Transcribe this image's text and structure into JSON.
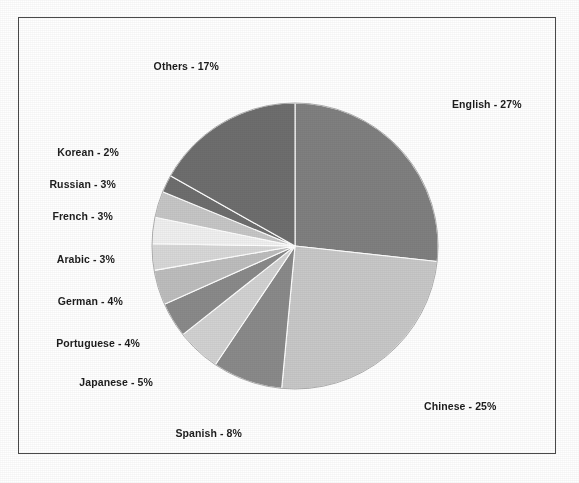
{
  "chart_data": {
    "type": "pie",
    "title": "",
    "subtitle": "",
    "xlabel": "",
    "ylabel": "",
    "legend_position": "none",
    "grid": false,
    "unit": "%",
    "start_angle_deg": 0,
    "direction": "clockwise",
    "total": 100,
    "categories": [
      "English",
      "Chinese",
      "Spanish",
      "Japanese",
      "Portuguese",
      "German",
      "Arabic",
      "French",
      "Russian",
      "Korean",
      "Others"
    ],
    "values": [
      27,
      25,
      8,
      5,
      4,
      4,
      3,
      3,
      3,
      2,
      17
    ],
    "slices": [
      {
        "name": "English",
        "value": 27,
        "label": "English - 27%",
        "color": "#808080",
        "label_x": 452,
        "label_y": 104,
        "align": "left"
      },
      {
        "name": "Chinese",
        "value": 25,
        "label": "Chinese - 25%",
        "color": "#c8c8c8",
        "label_x": 424,
        "label_y": 406,
        "align": "left"
      },
      {
        "name": "Spanish",
        "value": 8,
        "label": "Spanish - 8%",
        "color": "#8a8a8a",
        "label_x": 242,
        "label_y": 433,
        "align": "right"
      },
      {
        "name": "Japanese",
        "value": 5,
        "label": "Japanese - 5%",
        "color": "#d2d2d2",
        "label_x": 153,
        "label_y": 382,
        "align": "right"
      },
      {
        "name": "Portuguese",
        "value": 4,
        "label": "Portuguese - 4%",
        "color": "#8a8a8a",
        "label_x": 140,
        "label_y": 343,
        "align": "right"
      },
      {
        "name": "German",
        "value": 4,
        "label": "German - 4%",
        "color": "#bdbdbd",
        "label_x": 123,
        "label_y": 301,
        "align": "right"
      },
      {
        "name": "Arabic",
        "value": 3,
        "label": "Arabic - 3%",
        "color": "#d8d8d8",
        "label_x": 115,
        "label_y": 259,
        "align": "right"
      },
      {
        "name": "French",
        "value": 3,
        "label": "French - 3%",
        "color": "#f0f0f0",
        "label_x": 113,
        "label_y": 216,
        "align": "right"
      },
      {
        "name": "Russian",
        "value": 3,
        "label": "Russian - 3%",
        "color": "#c6c6c6",
        "label_x": 116,
        "label_y": 184,
        "align": "right"
      },
      {
        "name": "Korean",
        "value": 2,
        "label": "Korean - 2%",
        "color": "#6e6e6e",
        "label_x": 119,
        "label_y": 152,
        "align": "right"
      },
      {
        "name": "Others",
        "value": 17,
        "label": "Others - 17%",
        "color": "#6e6e6e",
        "label_x": 219,
        "label_y": 66,
        "align": "right"
      }
    ],
    "geometry": {
      "center_x": 295,
      "center_y": 246,
      "radius": 143,
      "separator_color": "#ffffff",
      "separator_width": 1.1
    },
    "frame": {
      "border_color": "#4a4a4a",
      "background": "#ffffff"
    }
  }
}
